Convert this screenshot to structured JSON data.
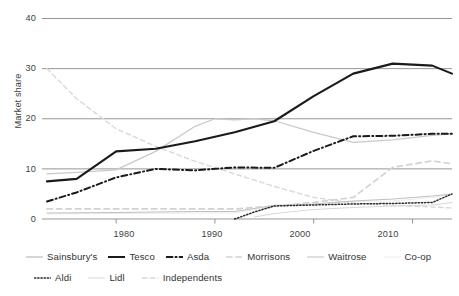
{
  "chart_data": {
    "type": "line",
    "title": "",
    "xlabel": "",
    "ylabel": "Market share",
    "xlim": [
      1973,
      2014
    ],
    "ylim": [
      0,
      40
    ],
    "grid": true,
    "legend_position": "bottom",
    "y_ticks": [
      "0",
      "10",
      "20",
      "30",
      "40"
    ],
    "y_tick_values": [
      0,
      10,
      20,
      30,
      40
    ],
    "x_ticks": [
      "1980",
      "1990",
      "2000",
      "2010"
    ],
    "x_tick_values": [
      1980,
      1990,
      2000,
      2010
    ],
    "series": [
      {
        "name": "Sainsbury's",
        "style": "solid",
        "color": "#c9c9c9",
        "width": 1.3,
        "x": [
          1973,
          1976,
          1980,
          1984,
          1988,
          1990,
          1992,
          1994,
          1996,
          2000,
          2004,
          2008,
          2012,
          2014
        ],
        "values": [
          9.0,
          9.3,
          9.8,
          13.5,
          18.5,
          20.0,
          19.8,
          20.0,
          19.6,
          17.3,
          15.3,
          15.8,
          16.7,
          17.0
        ]
      },
      {
        "name": "Tesco",
        "style": "solid",
        "color": "#1a1a1a",
        "width": 2.1,
        "x": [
          1973,
          1976,
          1980,
          1984,
          1988,
          1992,
          1996,
          2000,
          2004,
          2008,
          2012,
          2014
        ],
        "values": [
          7.5,
          8.0,
          13.5,
          14.0,
          15.5,
          17.3,
          19.5,
          24.5,
          29.0,
          31.0,
          30.6,
          29.0
        ]
      },
      {
        "name": "Asda",
        "style": "dashdot",
        "color": "#1a1a1a",
        "width": 2.0,
        "x": [
          1973,
          1976,
          1980,
          1984,
          1988,
          1992,
          1996,
          2000,
          2004,
          2008,
          2012,
          2014
        ],
        "values": [
          3.5,
          5.3,
          8.3,
          10.0,
          9.7,
          10.3,
          10.2,
          13.6,
          16.5,
          16.6,
          17.0,
          17.0
        ]
      },
      {
        "name": "Morrisons",
        "style": "dashed",
        "color": "#d2d2d2",
        "width": 1.7,
        "x": [
          1973,
          1980,
          1988,
          1992,
          1996,
          2000,
          2004,
          2008,
          2012,
          2014
        ],
        "values": [
          2.0,
          2.0,
          2.0,
          2.0,
          2.6,
          3.3,
          4.3,
          10.3,
          11.6,
          11.0
        ]
      },
      {
        "name": "Waitrose",
        "style": "solid",
        "color": "#bfbfbf",
        "width": 1.1,
        "x": [
          1973,
          1980,
          1988,
          1992,
          1996,
          2000,
          2004,
          2008,
          2012,
          2014
        ],
        "values": [
          1.2,
          1.3,
          1.5,
          1.5,
          2.7,
          3.0,
          3.6,
          4.0,
          4.6,
          5.0
        ]
      },
      {
        "name": "Co-op",
        "style": "solid",
        "color": "#ececec",
        "width": 1.1,
        "x": [
          1973,
          1980,
          1988,
          1992,
          1996,
          2000,
          2004,
          2008,
          2012,
          2014
        ],
        "values": [
          1.0,
          1.1,
          1.2,
          1.2,
          2.5,
          3.0,
          3.5,
          3.6,
          4.3,
          4.9
        ]
      },
      {
        "name": "Aldi",
        "style": "dotted",
        "color": "#2a2a2a",
        "width": 1.5,
        "x": [
          1992,
          1994,
          1996,
          2000,
          2004,
          2008,
          2012,
          2014
        ],
        "values": [
          0.0,
          1.4,
          2.6,
          2.8,
          3.0,
          3.1,
          3.3,
          5.0
        ]
      },
      {
        "name": "Lidl",
        "style": "solid",
        "color": "#d8d8d8",
        "width": 1.1,
        "x": [
          1994,
          1996,
          2000,
          2004,
          2008,
          2012,
          2014
        ],
        "values": [
          0.4,
          1.1,
          1.9,
          2.3,
          2.6,
          2.8,
          3.3
        ]
      },
      {
        "name": "Independents",
        "style": "dashed",
        "color": "#d9d9d9",
        "width": 1.4,
        "x": [
          1973,
          1976,
          1980,
          1984,
          1988,
          1992,
          1996,
          2000,
          2004,
          2008,
          2012,
          2014
        ],
        "values": [
          30.0,
          24.0,
          18.0,
          14.5,
          11.5,
          9.0,
          6.5,
          4.3,
          3.2,
          2.7,
          2.4,
          2.2
        ]
      }
    ]
  },
  "axes": {
    "ylabel": "Market share",
    "y_ticks": [
      "40",
      "30",
      "20",
      "10",
      "0"
    ],
    "x_ticks": [
      "1980",
      "1990",
      "2000",
      "2010"
    ]
  },
  "legend": {
    "row1": [
      {
        "label": "Sainsbury's",
        "key": "line-key-sainsburys"
      },
      {
        "label": "Tesco",
        "key": "line-key-tesco"
      },
      {
        "label": "Asda",
        "key": "line-key-asda"
      },
      {
        "label": "Morrisons",
        "key": "line-key-morrisons"
      },
      {
        "label": "Waitrose",
        "key": "line-key-waitrose"
      },
      {
        "label": "Co-op",
        "key": "line-key-coop"
      }
    ],
    "row2": [
      {
        "label": "Aldi",
        "key": "line-key-aldi"
      },
      {
        "label": "Lidl",
        "key": "line-key-lidl"
      },
      {
        "label": "Independents",
        "key": "line-key-independents"
      }
    ]
  }
}
